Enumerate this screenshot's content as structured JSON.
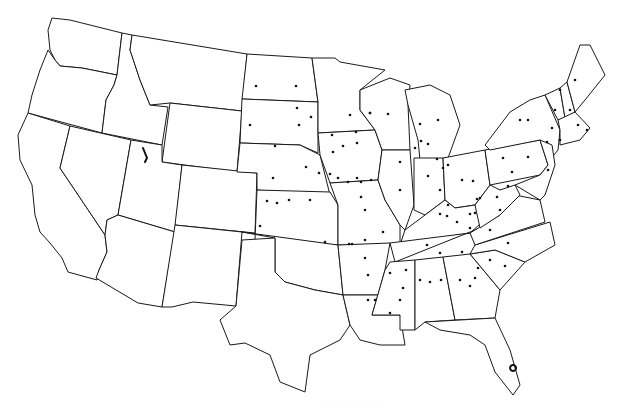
{
  "map": {
    "title": "United States (contiguous) state outline map with point markers",
    "colors": {
      "background": "#ffffff",
      "outline": "#1a1a1a",
      "marker": "#111111"
    },
    "states": [
      {
        "name": "Washington",
        "d": "M52,18 L70,20 L122,33 L117,75 L82,68 L60,66 L55,60 L50,50 L48,30 Z"
      },
      {
        "name": "Oregon",
        "d": "M48,50 L55,60 L60,66 L82,68 L117,75 L114,85 L106,100 L102,133 L28,113 L32,95 L40,70 Z"
      },
      {
        "name": "California",
        "d": "M28,113 L70,126 L60,168 L105,235 L107,252 L99,270 L97,280 L68,272 L62,258 L50,243 L40,232 L35,215 L32,185 L20,160 L18,135 Z"
      },
      {
        "name": "Idaho",
        "d": "M122,33 L132,35 L130,50 L140,80 L150,105 L168,107 L162,145 L102,133 L106,100 L114,85 L117,75 Z"
      },
      {
        "name": "Nevada",
        "d": "M70,126 L131,140 L118,215 L107,220 L105,235 L60,168 Z"
      },
      {
        "name": "Montana",
        "d": "M132,35 L247,54 L242,111 L170,103 L150,105 L140,80 L130,50 Z"
      },
      {
        "name": "Wyoming",
        "d": "M170,103 L242,111 L237,172 L162,162 Z"
      },
      {
        "name": "Utah",
        "d": "M131,140 L162,145 L162,162 L182,165 L175,232 L118,215 Z"
      },
      {
        "name": "Arizona",
        "d": "M118,215 L175,232 L162,307 L138,303 L96,278 L99,270 L107,252 L105,235 L107,220 Z"
      },
      {
        "name": "Colorado",
        "d": "M182,165 L257,173 L255,233 L175,225 Z"
      },
      {
        "name": "New Mexico",
        "d": "M175,225 L242,232 L236,306 L193,302 L172,307 L162,307 Z"
      },
      {
        "name": "North Dakota",
        "d": "M247,54 L312,58 L318,102 L242,99 Z"
      },
      {
        "name": "South Dakota",
        "d": "M242,99 L318,102 L318,153 L300,145 L240,143 Z"
      },
      {
        "name": "Nebraska",
        "d": "M240,143 L300,145 L320,155 L330,195 L257,190 L257,173 L237,172 Z"
      },
      {
        "name": "Kansas",
        "d": "M257,190 L330,192 L338,205 L338,245 L255,240 Z"
      },
      {
        "name": "Oklahoma",
        "d": "M242,232 L338,245 L343,295 L315,290 L285,282 L275,272 L275,238 Z"
      },
      {
        "name": "Texas",
        "d": "M236,306 L242,240 L275,238 L275,272 L285,282 L315,290 L343,295 L350,325 L340,340 L310,355 L305,392 L280,382 L270,355 L245,343 L230,345 L220,320 Z"
      },
      {
        "name": "Minnesota",
        "d": "M312,58 L335,58 L340,62 L385,70 L360,90 L360,110 L375,130 L318,133 L318,102 Z"
      },
      {
        "name": "Iowa",
        "d": "M318,133 L375,130 L382,150 L378,180 L330,183 L320,155 Z"
      },
      {
        "name": "Missouri",
        "d": "M330,183 L378,180 L385,200 L400,225 L400,245 L338,245 L338,205 Z"
      },
      {
        "name": "Arkansas",
        "d": "M338,245 L390,243 L385,270 L378,295 L343,295 Z"
      },
      {
        "name": "Louisiana",
        "d": "M343,295 L378,295 L372,315 L400,315 L405,345 L380,345 L360,340 L350,325 Z"
      },
      {
        "name": "Wisconsin",
        "d": "M360,90 L390,78 L410,85 L408,105 L410,150 L382,150 L375,130 L360,110 Z"
      },
      {
        "name": "Illinois",
        "d": "M382,150 L410,150 L414,205 L405,230 L400,225 L385,200 L378,180 Z"
      },
      {
        "name": "Michigan",
        "d": "M405,90 L430,85 L450,95 L460,125 L448,158 L420,160 L418,140 L408,105 Z"
      },
      {
        "name": "Indiana",
        "d": "M414,158 L443,158 L445,200 L425,215 L414,210 Z"
      },
      {
        "name": "Ohio",
        "d": "M443,158 L485,150 L490,185 L475,205 L455,208 L445,200 Z"
      },
      {
        "name": "Kentucky",
        "d": "M405,230 L425,215 L445,200 L455,208 L475,205 L490,215 L470,233 L400,245 Z"
      },
      {
        "name": "Tennessee",
        "d": "M390,243 L470,233 L480,228 L395,262 Z"
      },
      {
        "name": "Mississippi",
        "d": "M390,262 L415,260 L415,330 L400,330 L400,315 L372,315 L385,270 Z"
      },
      {
        "name": "Alabama",
        "d": "M415,260 L443,257 L455,320 L425,322 L415,330 Z"
      },
      {
        "name": "Georgia",
        "d": "M443,257 L470,254 L500,290 L495,318 L455,320 Z"
      },
      {
        "name": "Florida",
        "d": "M425,322 L495,318 L510,350 L520,385 L513,395 L495,372 L485,345 L470,335 L440,330 Z"
      },
      {
        "name": "South Carolina",
        "d": "M470,254 L495,250 L525,262 L500,290 Z"
      },
      {
        "name": "North Carolina",
        "d": "M475,245 L550,222 L555,245 L525,262 L495,250 L470,254 Z"
      },
      {
        "name": "Virginia",
        "d": "M470,233 L500,215 L515,195 L540,200 L545,222 L475,245 Z"
      },
      {
        "name": "West Virginia",
        "d": "M475,205 L490,185 L500,190 L515,185 L520,195 L500,215 L480,228 Z"
      },
      {
        "name": "Pennsylvania",
        "d": "M485,150 L540,140 L548,165 L540,175 L490,185 Z"
      },
      {
        "name": "New York",
        "d": "M485,145 L510,112 L530,100 L545,95 L560,130 L558,150 L550,160 L540,140 L490,150 Z"
      },
      {
        "name": "Maryland/Delaware/New Jersey",
        "d": "M540,140 L552,145 L555,165 L545,195 L540,200 L515,185 L540,175 L548,165 Z"
      },
      {
        "name": "Vermont",
        "d": "M545,95 L560,88 L565,118 L558,120 Z"
      },
      {
        "name": "New Hampshire",
        "d": "M560,88 L567,82 L575,112 L565,118 Z"
      },
      {
        "name": "Maine",
        "d": "M567,82 L580,45 L590,45 L605,75 L585,100 L575,112 Z"
      },
      {
        "name": "Massachusetts/Connecticut/Rhode Island",
        "d": "M558,120 L575,112 L590,128 L580,140 L560,145 L560,130 Z"
      }
    ],
    "water": [
      {
        "name": "Great Salt Lake",
        "d": "M143,148 L147,158 L145,162"
      },
      {
        "name": "Lake Okeechobee",
        "d": "M513,365 a3,3 0 1,0 0.1,0"
      }
    ],
    "markers": [
      [
        256,
        86
      ],
      [
        296,
        86
      ],
      [
        297,
        108
      ],
      [
        311,
        117
      ],
      [
        299,
        125
      ],
      [
        250,
        125
      ],
      [
        275,
        146
      ],
      [
        273,
        178
      ],
      [
        306,
        167
      ],
      [
        289,
        200
      ],
      [
        277,
        203
      ],
      [
        267,
        201
      ],
      [
        310,
        200
      ],
      [
        260,
        226
      ],
      [
        330,
        174
      ],
      [
        348,
        182
      ],
      [
        356,
        132
      ],
      [
        332,
        135
      ],
      [
        343,
        146
      ],
      [
        333,
        152
      ],
      [
        357,
        143
      ],
      [
        350,
        115
      ],
      [
        370,
        113
      ],
      [
        319,
        173
      ],
      [
        338,
        178
      ],
      [
        357,
        178
      ],
      [
        361,
        197
      ],
      [
        388,
        114
      ],
      [
        370,
        113
      ],
      [
        361,
        182
      ],
      [
        371,
        180
      ],
      [
        400,
        162
      ],
      [
        415,
        148
      ],
      [
        400,
        190
      ],
      [
        365,
        210
      ],
      [
        421,
        141
      ],
      [
        428,
        144
      ],
      [
        420,
        124
      ],
      [
        438,
        120
      ],
      [
        437,
        159
      ],
      [
        448,
        165
      ],
      [
        428,
        176
      ],
      [
        443,
        168
      ],
      [
        440,
        190
      ],
      [
        462,
        180
      ],
      [
        448,
        205
      ],
      [
        473,
        181
      ],
      [
        477,
        199
      ],
      [
        440,
        214
      ],
      [
        457,
        222
      ],
      [
        470,
        214
      ],
      [
        480,
        198
      ],
      [
        447,
        216
      ],
      [
        497,
        197
      ],
      [
        508,
        186
      ],
      [
        470,
        228
      ],
      [
        475,
        213
      ],
      [
        500,
        210
      ],
      [
        512,
        172
      ],
      [
        503,
        158
      ],
      [
        528,
        157
      ],
      [
        552,
        128
      ],
      [
        547,
        142
      ],
      [
        560,
        140
      ],
      [
        555,
        110
      ],
      [
        570,
        110
      ],
      [
        578,
        125
      ],
      [
        587,
        130
      ],
      [
        575,
        80
      ],
      [
        560,
        90
      ],
      [
        520,
        120
      ],
      [
        528,
        120
      ],
      [
        548,
        170
      ],
      [
        352,
        244
      ],
      [
        365,
        258
      ],
      [
        368,
        275
      ],
      [
        368,
        300
      ],
      [
        390,
        273
      ],
      [
        406,
        270
      ],
      [
        403,
        288
      ],
      [
        400,
        300
      ],
      [
        390,
        313
      ],
      [
        420,
        280
      ],
      [
        430,
        282
      ],
      [
        441,
        280
      ],
      [
        460,
        280
      ],
      [
        475,
        278
      ],
      [
        505,
        266
      ],
      [
        490,
        260
      ],
      [
        478,
        268
      ],
      [
        470,
        286
      ],
      [
        375,
        300
      ],
      [
        325,
        242
      ],
      [
        349,
        244
      ],
      [
        383,
        232
      ],
      [
        365,
        240
      ],
      [
        427,
        245
      ],
      [
        440,
        253
      ],
      [
        462,
        252
      ],
      [
        490,
        230
      ],
      [
        508,
        243
      ]
    ]
  },
  "caption": "· · · · · · · ·"
}
